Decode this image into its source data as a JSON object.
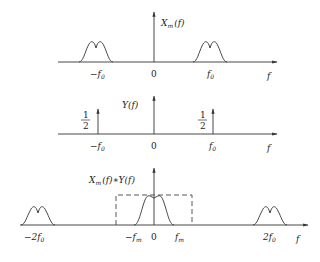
{
  "panels": [
    {
      "id": "modulated-spectrum",
      "ylabel": "Xm(f)",
      "ylabel_main": "X",
      "ylabel_sub": "m",
      "ylabel_arg": "(f)",
      "xlabel": "f",
      "ticks": [
        "-f0",
        "0",
        "f0"
      ],
      "tick_labels": {
        "neg": "−f",
        "zero": "0",
        "pos": "f",
        "sub": "0"
      }
    },
    {
      "id": "carrier-spectrum",
      "ylabel": "Y(f)",
      "xlabel": "f",
      "impulse_weight": {
        "num": "1",
        "den": "2"
      },
      "ticks": [
        "-f0",
        "0",
        "f0"
      ],
      "tick_labels": {
        "neg": "−f",
        "zero": "0",
        "pos": "f",
        "sub": "0"
      }
    },
    {
      "id": "convolution-spectrum",
      "ylabel": "Xm(f)*Y(f)",
      "ylabel_parts": {
        "x": "X",
        "sub": "m",
        "rest": "(f)∗Y(f)"
      },
      "xlabel": "f",
      "ticks": [
        "-2f0",
        "-fm",
        "0",
        "fm",
        "2f0"
      ],
      "tick_labels": {
        "neg2": "−2f",
        "negm": "−f",
        "zero": "0",
        "posm": "f",
        "pos2": "2f",
        "sub0": "0",
        "subm": "m"
      },
      "filter": "dashed-lowpass-window"
    }
  ]
}
